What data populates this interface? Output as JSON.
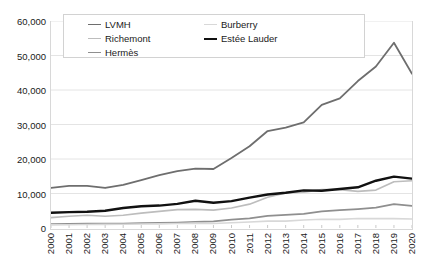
{
  "chart_data": {
    "type": "line",
    "title": "",
    "xlabel": "",
    "ylabel": "",
    "x": [
      2000,
      2001,
      2002,
      2003,
      2004,
      2005,
      2006,
      2007,
      2008,
      2009,
      2010,
      2011,
      2012,
      2013,
      2014,
      2015,
      2016,
      2017,
      2018,
      2019,
      2020
    ],
    "tick_labels": [
      "2000",
      "2001",
      "2002",
      "2003",
      "2004",
      "2005",
      "2006",
      "2007",
      "2008",
      "2009",
      "2010",
      "2011",
      "2012",
      "2013",
      "2014",
      "2015",
      "2016",
      "2017",
      "2018",
      "2019",
      "2020"
    ],
    "ylim": [
      0,
      60000
    ],
    "yticks": [
      0,
      10000,
      20000,
      30000,
      40000,
      50000,
      60000
    ],
    "ytick_labels": [
      "0",
      "10,000",
      "20,000",
      "30,000",
      "40,000",
      "50,000",
      "60,000"
    ],
    "grid": true,
    "legend_position": "top",
    "series": [
      {
        "name": "LVMH",
        "color": "#6e6e6e",
        "width": 1.8,
        "values": [
          11600,
          12200,
          12200,
          11600,
          12500,
          13900,
          15300,
          16500,
          17200,
          17100,
          20300,
          23700,
          28100,
          29100,
          30600,
          35700,
          37600,
          42600,
          46800,
          53700,
          44700
        ]
      },
      {
        "name": "Richemont",
        "color": "#bdbdbd",
        "width": 1.7,
        "values": [
          3000,
          3400,
          3700,
          3400,
          3700,
          4300,
          4800,
          5300,
          5400,
          5200,
          5800,
          6900,
          8900,
          10200,
          10400,
          11100,
          11100,
          10600,
          11000,
          13400,
          13700
        ]
      },
      {
        "name": "Hermès",
        "color": "#8f8f8f",
        "width": 1.7,
        "values": [
          1100,
          1200,
          1250,
          1250,
          1300,
          1400,
          1500,
          1600,
          1800,
          1900,
          2400,
          2800,
          3500,
          3800,
          4100,
          4800,
          5200,
          5500,
          5900,
          6900,
          6400
        ]
      },
      {
        "name": "Burberry",
        "color": "#d8d8d8",
        "width": 1.6,
        "values": [
          900,
          950,
          1000,
          1050,
          1100,
          1150,
          1200,
          1300,
          1400,
          1300,
          1500,
          1750,
          1990,
          2000,
          2330,
          2520,
          2510,
          2770,
          2730,
          2720,
          2630
        ]
      },
      {
        "name": "Estée Lauder",
        "color": "#111111",
        "width": 2.4,
        "values": [
          4400,
          4600,
          4700,
          5000,
          5800,
          6300,
          6500,
          7000,
          7900,
          7300,
          7800,
          8800,
          9700,
          10200,
          10900,
          10800,
          11300,
          11800,
          13700,
          14900,
          14300
        ]
      }
    ]
  }
}
